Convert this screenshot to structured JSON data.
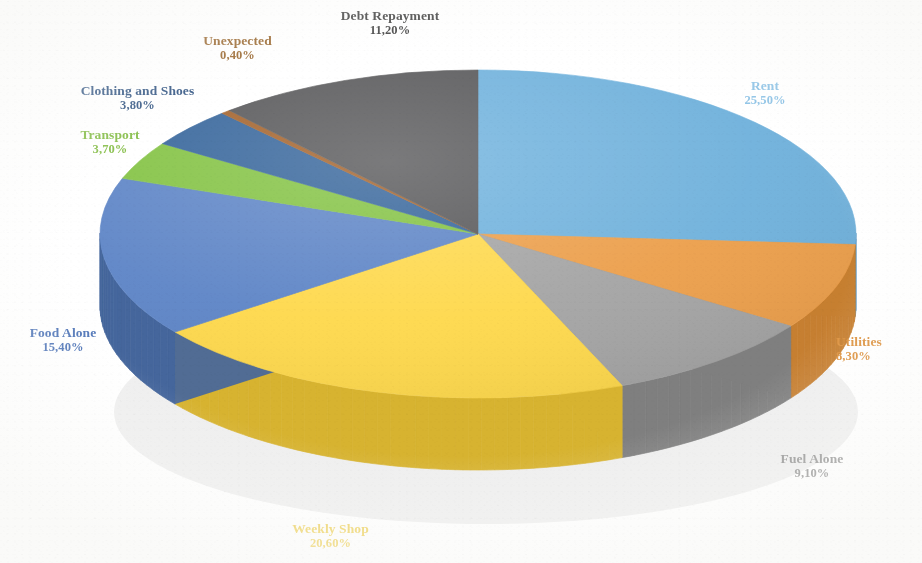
{
  "chart_data": {
    "type": "pie",
    "title": "",
    "subtitle": "",
    "xlabel": "",
    "ylabel": "",
    "legend_position": "none",
    "grid": false,
    "three_d": true,
    "decimal_separator": ",",
    "value_suffix": "%",
    "categories": [
      "Rent",
      "Utilities",
      "Fuel Alone",
      "Weekly Shop",
      "Food Alone",
      "Transport",
      "Clothing and Shoes",
      "Unexpected",
      "Debt Repayment"
    ],
    "values": [
      25.5,
      8.3,
      9.1,
      20.6,
      15.4,
      3.7,
      3.8,
      0.4,
      11.2
    ],
    "value_labels": [
      "25,50%",
      "8,30%",
      "9,10%",
      "20,60%",
      "15,40%",
      "3,70%",
      "3,80%",
      "0,40%",
      "11,20%"
    ],
    "colors": [
      "#6FB2DE",
      "#EEA04A",
      "#A5A5A5",
      "#FFD94A",
      "#5E86C9",
      "#83C441",
      "#36669E",
      "#A5632A",
      "#59595B"
    ],
    "side_colors": [
      "#4B8DBB",
      "#C87F2E",
      "#7F7F7F",
      "#D8B32C",
      "#44669E",
      "#66A02C",
      "#27496F",
      "#7C4A1E",
      "#3C3C3E"
    ],
    "slices": [
      {
        "label": "Rent",
        "value": 25.5,
        "value_label": "25,50%",
        "color": "#6FB2DE"
      },
      {
        "label": "Utilities",
        "value": 8.3,
        "value_label": "8,30%",
        "color": "#EEA04A"
      },
      {
        "label": "Fuel Alone",
        "value": 9.1,
        "value_label": "9,10%",
        "color": "#A5A5A5"
      },
      {
        "label": "Weekly Shop",
        "value": 20.6,
        "value_label": "20,60%",
        "color": "#FFD94A"
      },
      {
        "label": "Food Alone",
        "value": 15.4,
        "value_label": "15,40%",
        "color": "#5E86C9"
      },
      {
        "label": "Transport",
        "value": 3.7,
        "value_label": "3,70%",
        "color": "#83C441"
      },
      {
        "label": "Clothing and Shoes",
        "value": 3.8,
        "value_label": "3,80%",
        "color": "#36669E"
      },
      {
        "label": "Unexpected",
        "value": 0.4,
        "value_label": "0,40%",
        "color": "#A5632A"
      },
      {
        "label": "Debt Repayment",
        "value": 11.2,
        "value_label": "11,20%",
        "color": "#59595B"
      }
    ]
  },
  "labels": {
    "rent": {
      "name": "Rent",
      "pct": "25,50%"
    },
    "utilities": {
      "name": "Utilities",
      "pct": "8,30%"
    },
    "fuel": {
      "name": "Fuel Alone",
      "pct": "9,10%"
    },
    "weekly": {
      "name": "Weekly Shop",
      "pct": "20,60%"
    },
    "food": {
      "name": "Food Alone",
      "pct": "15,40%"
    },
    "transport": {
      "name": "Transport",
      "pct": "3,70%"
    },
    "clothing": {
      "name": "Clothing and Shoes",
      "pct": "3,80%"
    },
    "unexpected": {
      "name": "Unexpected",
      "pct": "0,40%"
    },
    "debt": {
      "name": "Debt Repayment",
      "pct": "11,20%"
    }
  }
}
